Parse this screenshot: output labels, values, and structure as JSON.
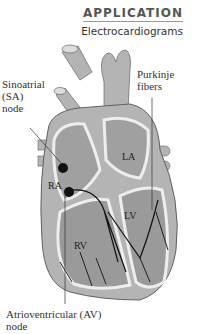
{
  "header": {
    "category": "APPLICATION",
    "title": "Electrocardiograms"
  },
  "labels": {
    "sa_node": [
      "Sinoatrial",
      "(SA)",
      "node"
    ],
    "purkinje": [
      "Purkinje",
      "fibers"
    ],
    "av_node": [
      "Atrioventricular (AV)",
      "node"
    ],
    "la": "LA",
    "ra": "RA",
    "lv": "LV",
    "rv": "RV"
  },
  "colors": {
    "heart": "#b4b4b4",
    "heart_dark": "#8c8c8c",
    "wall": "#e6e6e6",
    "fiber": "#111111"
  }
}
